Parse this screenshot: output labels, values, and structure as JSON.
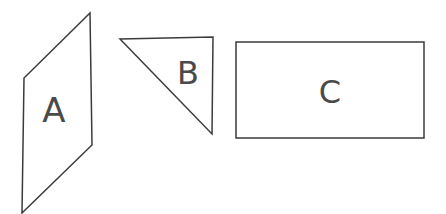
{
  "figure": {
    "background_color": "#ffffff",
    "stroke_color": "#3b3b3b",
    "label_color": "#4a4a4a",
    "stroke_width": 1.5,
    "width": 446,
    "height": 214
  },
  "chart_data": {
    "type": "diagram",
    "xlabel": "",
    "ylabel": "",
    "grid": false,
    "legend": "none",
    "shapes": [
      {
        "id": "A",
        "label": "A",
        "kind": "parallelogram",
        "points": "90,13 92,145 22,213 24,78",
        "label_x": 54,
        "label_y": 112
      },
      {
        "id": "B",
        "label": "B",
        "kind": "right-triangle",
        "points": "120,39 213,37 212,134",
        "label_x": 188,
        "label_y": 75
      },
      {
        "id": "C",
        "label": "C",
        "kind": "rectangle",
        "points": "236,42 424,42 424,138 236,138",
        "label_x": 330,
        "label_y": 94
      }
    ]
  },
  "labels": {
    "a": "A",
    "b": "B",
    "c": "C"
  }
}
